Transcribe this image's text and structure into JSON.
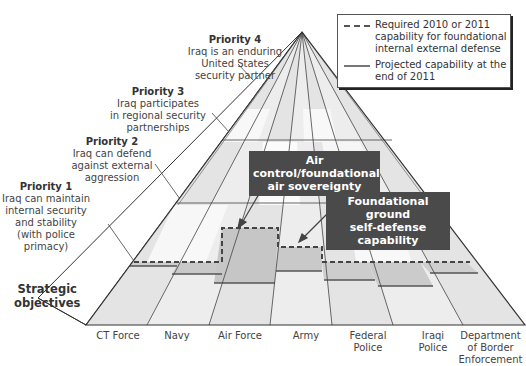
{
  "legend": {
    "required_label": "Required 2010 or 2011 capability for foundational internal external defense",
    "projected_label": "Projected capability at the end of 2011",
    "required_line_1": "Required 2010 or 2011",
    "required_line_2": "capability for foundational",
    "required_line_3": "internal external defense",
    "projected_line_1": "Projected capability at the",
    "projected_line_2": "end of 2011"
  },
  "priorities": [
    {
      "title": "Priority 4",
      "lines": [
        "Iraq is an enduring",
        "United States",
        "security partner"
      ]
    },
    {
      "title": "Priority 3",
      "lines": [
        "Iraq participates",
        "in regional security",
        "partnerships"
      ]
    },
    {
      "title": "Priority 2",
      "lines": [
        "Iraq can defend",
        "against external",
        "aggression"
      ]
    },
    {
      "title": "Priority 1",
      "lines": [
        "Iraq can maintain",
        "internal security",
        "and stability",
        "(with police",
        "primacy)"
      ]
    }
  ],
  "strategic_objectives": {
    "line_1": "Strategic",
    "line_2": "objectives"
  },
  "columns": [
    {
      "label_1": "CT Force",
      "label_2": "",
      "label_3": ""
    },
    {
      "label_1": "Navy",
      "label_2": "",
      "label_3": ""
    },
    {
      "label_1": "Air Force",
      "label_2": "",
      "label_3": ""
    },
    {
      "label_1": "Army",
      "label_2": "",
      "label_3": ""
    },
    {
      "label_1": "Federal",
      "label_2": "Police",
      "label_3": ""
    },
    {
      "label_1": "Iraqi",
      "label_2": "Police",
      "label_3": ""
    },
    {
      "label_1": "Department",
      "label_2": "of Border",
      "label_3": "Enforcement"
    }
  ],
  "callouts": {
    "air": {
      "line_1": "Air control/foundational",
      "line_2": "air sovereignty"
    },
    "ground": {
      "line_1": "Foundational ground",
      "line_2": "self-defense capability"
    }
  },
  "colors": {
    "band_light": "#e6e6e6",
    "band_white": "#f7f7f7",
    "capability_fill": "#cfcfcf",
    "callout_bg": "#4a4a4a",
    "outline": "#333333"
  }
}
